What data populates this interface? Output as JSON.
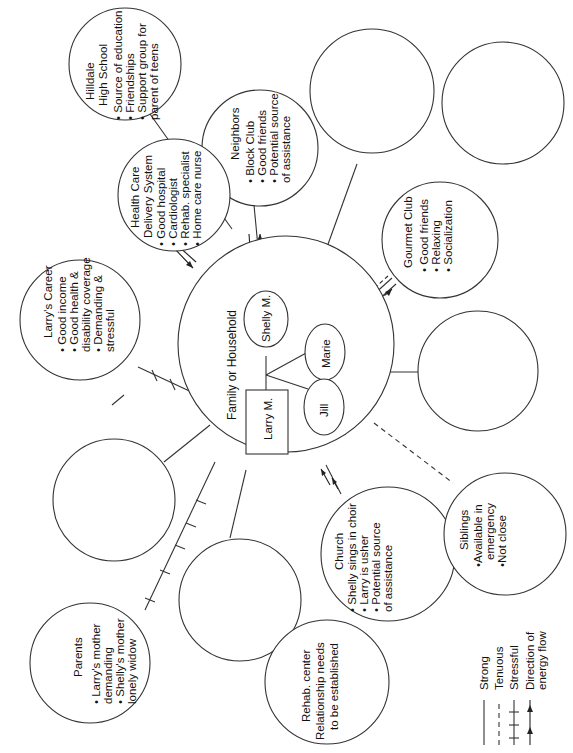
{
  "diagram": {
    "type": "ecomap",
    "orientation": "rotated -90deg (text reads bottom-to-top)",
    "center": {
      "label": "Family or Household",
      "members": [
        {
          "name": "Larry M.",
          "shape": "rectangle",
          "gender": "male"
        },
        {
          "name": "Shelly M.",
          "shape": "ellipse",
          "gender": "female"
        },
        {
          "name": "Marie",
          "shape": "ellipse"
        },
        {
          "name": "Jill",
          "shape": "ellipse"
        }
      ]
    },
    "systems": [
      {
        "id": "hilldale",
        "title": [
          "Hilldale",
          "High School"
        ],
        "items": [
          "Source of education",
          "Friendships",
          "Support group for",
          "parent of teens"
        ],
        "connection": "strong",
        "flow": "bidirectional"
      },
      {
        "id": "neighbors",
        "title": [
          "Neighbors"
        ],
        "items": [
          "Block Club",
          "Good friends",
          "Potential source",
          "of assistance"
        ],
        "connection": "strong",
        "flow": "bidirectional"
      },
      {
        "id": "health-care",
        "title": [
          "Health Care",
          "Delivery System"
        ],
        "items": [
          "Good hospital",
          "Cardiologist",
          "Rehab. specialist",
          "Home care nurse"
        ],
        "connection": "strong",
        "flow": "toward family"
      },
      {
        "id": "larrys-career",
        "title": [
          "Larry's Career"
        ],
        "items": [
          "Good income",
          "Good health &",
          "disability coverage",
          "Demanding &",
          "stressful"
        ],
        "connection": "stressful"
      },
      {
        "id": "gourmet-club",
        "title": [
          "Gourmet Club"
        ],
        "items": [
          "Good friends",
          "Relaxing",
          "Socialization"
        ],
        "connection": "strong",
        "flow": "bidirectional"
      },
      {
        "id": "church",
        "title": [
          "Church"
        ],
        "items": [
          "Shelly sings in choir",
          "Larry is usher",
          "Potential source",
          "of assistance"
        ],
        "connection": "strong",
        "flow": "toward family"
      },
      {
        "id": "siblings",
        "title": [
          "Siblings"
        ],
        "items": [
          "Available in",
          "emergency",
          "Not close"
        ],
        "connection": "tenuous"
      },
      {
        "id": "parents",
        "title": [
          "Parents"
        ],
        "items": [
          "Larry's mother",
          "demanding",
          "Shelly's mother",
          "lonely widow"
        ],
        "connection": "stressful"
      },
      {
        "id": "rehab-center",
        "title": [
          "Rehab. center"
        ],
        "items": [
          "Relationship needs",
          "to be established"
        ],
        "connection": "none"
      }
    ],
    "empty_circles": 6,
    "legend": [
      {
        "style": "solid",
        "label": "Strong"
      },
      {
        "style": "dashed",
        "label": "Tenuous"
      },
      {
        "style": "hatched",
        "label": "Stressful"
      },
      {
        "style": "arrow",
        "label": [
          "Direction of",
          "energy flow"
        ]
      }
    ]
  }
}
